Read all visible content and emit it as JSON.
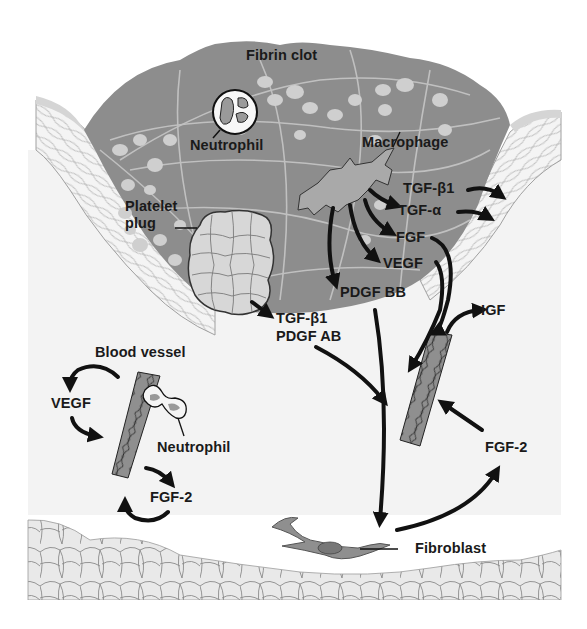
{
  "colors": {
    "background": "#ffffff",
    "dermis": "#f2f2f2",
    "clot": "#8c8c8c",
    "fibrin": "#c9c9c9",
    "platelet": "#d6d6d6",
    "cell_fill": "#a6a6a6",
    "arrow": "#111111",
    "text": "#1a1a1a",
    "epidermis_band": "#d9d9d9",
    "fat_cells": "#e8e8e8"
  },
  "labels": {
    "fibrin_clot": "Fibrin clot",
    "neutrophil_top": "Neutrophil",
    "macrophage": "Macrophage",
    "platelet_plug_line1": "Platelet",
    "platelet_plug_line2": "plug",
    "tgf_b1_macro": "TGF-β1",
    "tgf_a": "TGF-α",
    "fgf": "FGF",
    "vegf_macro": "VEGF",
    "pdgf_bb": "PDGF BB",
    "tgf_b1_platelet": "TGF-β1",
    "pdgf_ab": "PDGF AB",
    "igf": "IGF",
    "blood_vessel": "Blood vessel",
    "vegf_left": "VEGF",
    "neutrophil_vessel": "Neutrophil",
    "fgf2_left": "FGF-2",
    "fgf2_right": "FGF-2",
    "fibroblast": "Fibroblast"
  }
}
